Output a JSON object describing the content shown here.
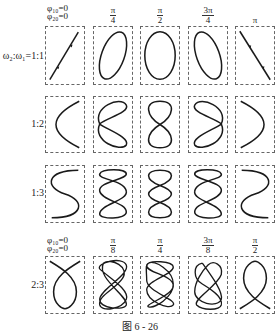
{
  "figure": {
    "caption": "图 6 - 26",
    "ratio_prefix": "ω₂:ω₁=",
    "rows": [
      {
        "ratio_label": "ω₂:ω₁=1:1",
        "phases": [
          {
            "type": "zero",
            "line1": "φ₁₀=0",
            "line2": "φ₂₀=0"
          },
          {
            "type": "frac",
            "num": "π",
            "den": "4"
          },
          {
            "type": "frac",
            "num": "π",
            "den": "2"
          },
          {
            "type": "frac",
            "num": "3π",
            "den": "4"
          },
          {
            "type": "plain",
            "text": "π"
          }
        ]
      },
      {
        "ratio_label": "1:2"
      },
      {
        "ratio_label": "1:3"
      },
      {
        "ratio_label": "2:3",
        "phases": [
          {
            "type": "zero",
            "line1": "φ₁₀=0",
            "line2": "φ₂₀=0"
          },
          {
            "type": "frac",
            "num": "π",
            "den": "8"
          },
          {
            "type": "frac",
            "num": "π",
            "den": "4"
          },
          {
            "type": "frac",
            "num": "3π",
            "den": "8"
          },
          {
            "type": "frac",
            "num": "π",
            "den": "2"
          }
        ]
      }
    ],
    "stroke_color": "#1a1a1a",
    "box_border_color": "#666666"
  }
}
